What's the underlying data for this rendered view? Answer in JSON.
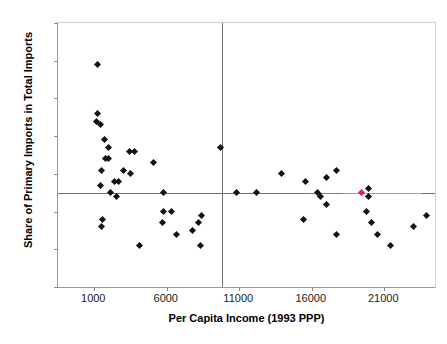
{
  "chart_data": {
    "type": "scatter",
    "title": "",
    "xlabel": "Per Capita Income (1993 PPP)",
    "ylabel": "Share of Primary Imports in Total Imports",
    "xlim": [
      -1500,
      24500
    ],
    "ylim": [
      0,
      70
    ],
    "xticks": [
      1000,
      6000,
      11000,
      16000,
      21000
    ],
    "xtick_labels": [
      "1000",
      "6000",
      "11000",
      "16000",
      "21000"
    ],
    "yticks": [
      0,
      10,
      20,
      30,
      40,
      50,
      60,
      70
    ],
    "ytick_labels": [
      "0",
      "10",
      "20",
      "30",
      "40",
      "50",
      "60",
      "70"
    ],
    "grid": false,
    "legend": null,
    "marker": "diamond",
    "marker_color": "#111111",
    "highlight_color": "#d6255a",
    "reference_lines": [
      {
        "orientation": "horizontal",
        "value": 25,
        "color": "#6e6e6e"
      },
      {
        "orientation": "vertical",
        "value": 9800,
        "color": "#6e6e6e"
      }
    ],
    "overlay_segments": [
      {
        "orientation": "horizontal",
        "value": 25,
        "x_start": 15600,
        "x_end": 18000,
        "color": "#2a9d9a"
      },
      {
        "orientation": "horizontal",
        "value": 25,
        "x_start": 18000,
        "x_end": 19700,
        "color": "#e8738f"
      },
      {
        "orientation": "horizontal",
        "value": 25,
        "x_start": 19700,
        "x_end": 23600,
        "color": "#5fb8b5"
      }
    ],
    "points": [
      {
        "x": 1200,
        "y": 59
      },
      {
        "x": 1250,
        "y": 46
      },
      {
        "x": 1150,
        "y": 44
      },
      {
        "x": 1450,
        "y": 43
      },
      {
        "x": 1700,
        "y": 39
      },
      {
        "x": 1950,
        "y": 37
      },
      {
        "x": 3400,
        "y": 36
      },
      {
        "x": 3800,
        "y": 36
      },
      {
        "x": 1750,
        "y": 34
      },
      {
        "x": 2000,
        "y": 34
      },
      {
        "x": 5100,
        "y": 33
      },
      {
        "x": 1500,
        "y": 31
      },
      {
        "x": 3000,
        "y": 31
      },
      {
        "x": 3500,
        "y": 30
      },
      {
        "x": 2400,
        "y": 28
      },
      {
        "x": 2700,
        "y": 28
      },
      {
        "x": 1400,
        "y": 27
      },
      {
        "x": 2150,
        "y": 25
      },
      {
        "x": 5800,
        "y": 25
      },
      {
        "x": 2550,
        "y": 24
      },
      {
        "x": 5750,
        "y": 20
      },
      {
        "x": 6300,
        "y": 20
      },
      {
        "x": 8400,
        "y": 19
      },
      {
        "x": 1550,
        "y": 18
      },
      {
        "x": 5700,
        "y": 17
      },
      {
        "x": 8200,
        "y": 17
      },
      {
        "x": 1500,
        "y": 16
      },
      {
        "x": 7800,
        "y": 15
      },
      {
        "x": 6700,
        "y": 14
      },
      {
        "x": 4100,
        "y": 11
      },
      {
        "x": 8300,
        "y": 11
      },
      {
        "x": 9700,
        "y": 37
      },
      {
        "x": 10800,
        "y": 25
      },
      {
        "x": 12200,
        "y": 25
      },
      {
        "x": 13900,
        "y": 30
      },
      {
        "x": 15600,
        "y": 28
      },
      {
        "x": 17000,
        "y": 29
      },
      {
        "x": 17700,
        "y": 31
      },
      {
        "x": 16400,
        "y": 25
      },
      {
        "x": 16600,
        "y": 24
      },
      {
        "x": 17000,
        "y": 22
      },
      {
        "x": 15400,
        "y": 18
      },
      {
        "x": 17700,
        "y": 14
      },
      {
        "x": 19400,
        "y": 25,
        "highlight": true
      },
      {
        "x": 19900,
        "y": 26
      },
      {
        "x": 19900,
        "y": 24
      },
      {
        "x": 19800,
        "y": 20
      },
      {
        "x": 20100,
        "y": 17
      },
      {
        "x": 20500,
        "y": 14
      },
      {
        "x": 21400,
        "y": 11
      },
      {
        "x": 23000,
        "y": 16
      },
      {
        "x": 23900,
        "y": 19
      }
    ]
  }
}
